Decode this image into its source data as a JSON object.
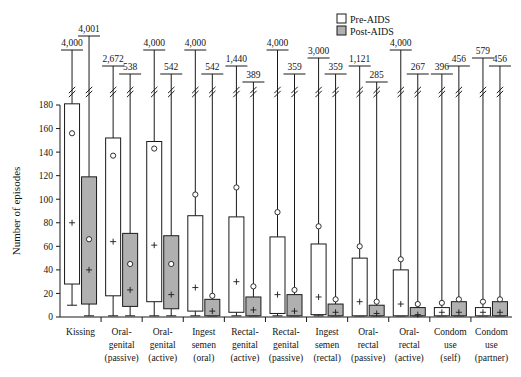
{
  "figure": {
    "y_axis_title": "Number of episodes",
    "legend": [
      {
        "key": "pre",
        "label": "Pre-AIDS",
        "color": "#ffffff"
      },
      {
        "key": "post",
        "label": "Post-AIDS",
        "color": "#b0b0b0"
      }
    ]
  },
  "chart_data": {
    "type": "bar",
    "title": "",
    "xlabel": "",
    "ylabel": "Number of episodes",
    "ylim": [
      0,
      180
    ],
    "yticks": [
      0,
      20,
      40,
      60,
      80,
      100,
      120,
      140,
      160,
      180
    ],
    "ytick_labels": [
      "0",
      "20",
      "40",
      "60",
      "80",
      "100",
      "120",
      "140",
      "160",
      "180"
    ],
    "grid": false,
    "legend_position": "top-right",
    "note": "Paired box-and-whisker plot. Each category has a Pre-AIDS (white) and Post-AIDS (grey) box. Upper whiskers are broken (axis break) and the true maximum is printed above each whisker.",
    "categories": [
      "Kissing",
      "Oral-genital (passive)",
      "Oral-genital (active)",
      "Ingest semen (oral)",
      "Rectal-genital (active)",
      "Rectal-genital (passive)",
      "Ingest semen (rectal)",
      "Oral-rectal (passive)",
      "Oral-rectal (active)",
      "Condom use (self)",
      "Condom use (partner)"
    ],
    "category_lines": [
      [
        "Kissing"
      ],
      [
        "Oral-",
        "genital",
        "(passive)"
      ],
      [
        "Oral-",
        "genital",
        "(active)"
      ],
      [
        "Ingest",
        "semen",
        "(oral)"
      ],
      [
        "Rectal-",
        "genital",
        "(active)"
      ],
      [
        "Rectal-",
        "genital",
        "(passive)"
      ],
      [
        "Ingest",
        "semen",
        "(rectal)"
      ],
      [
        "Oral-",
        "rectal",
        "(passive)"
      ],
      [
        "Oral-",
        "rectal",
        "(active)"
      ],
      [
        "Condom",
        "use",
        "(self)"
      ],
      [
        "Condom",
        "use",
        "(partner)"
      ]
    ],
    "series": [
      {
        "name": "Pre-AIDS",
        "color": "#ffffff",
        "boxes": [
          {
            "category": "Kissing",
            "q1": 28,
            "median": 181,
            "q3": 181,
            "lower_whisker": 10,
            "max_label": "4,000",
            "mean": 80,
            "marker_o": 156
          },
          {
            "category": "Oral-genital (passive)",
            "q1": 18,
            "median": 152,
            "q3": 152,
            "lower_whisker": 1,
            "max_label": "2,672",
            "mean": 64,
            "marker_o": 137
          },
          {
            "category": "Oral-genital (active)",
            "q1": 13,
            "median": 149,
            "q3": 149,
            "lower_whisker": 1,
            "max_label": "4,000",
            "mean": 61,
            "marker_o": 143
          },
          {
            "category": "Ingest semen (oral)",
            "q1": 5,
            "median": 86,
            "q3": 86,
            "lower_whisker": 1,
            "max_label": "4,000",
            "mean": 25,
            "marker_o": 104
          },
          {
            "category": "Rectal-genital (active)",
            "q1": 4,
            "median": 85,
            "q3": 85,
            "lower_whisker": 1,
            "max_label": "1,440",
            "mean": 30,
            "marker_o": 110
          },
          {
            "category": "Rectal-genital (passive)",
            "q1": 3,
            "median": 68,
            "q3": 68,
            "lower_whisker": 1,
            "max_label": "4,000",
            "mean": 19,
            "marker_o": 89
          },
          {
            "category": "Ingest semen (rectal)",
            "q1": 2,
            "median": 62,
            "q3": 62,
            "lower_whisker": 1,
            "max_label": "3,000",
            "mean": 17,
            "marker_o": 77
          },
          {
            "category": "Oral-rectal (passive)",
            "q1": 1,
            "median": 50,
            "q3": 50,
            "lower_whisker": 1,
            "max_label": "1,121",
            "mean": 13,
            "marker_o": 60
          },
          {
            "category": "Oral-rectal (active)",
            "q1": 1,
            "median": 40,
            "q3": 40,
            "lower_whisker": 1,
            "max_label": "4,000",
            "mean": 11,
            "marker_o": 49
          },
          {
            "category": "Condom use (self)",
            "q1": 1,
            "median": 6,
            "q3": 8,
            "lower_whisker": 1,
            "max_label": "396",
            "mean": 4,
            "marker_o": 12
          },
          {
            "category": "Condom use (partner)",
            "q1": 1,
            "median": 6,
            "q3": 8,
            "lower_whisker": 1,
            "max_label": "579",
            "mean": 4,
            "marker_o": 13
          }
        ]
      },
      {
        "name": "Post-AIDS",
        "color": "#b0b0b0",
        "boxes": [
          {
            "category": "Kissing",
            "q1": 11,
            "median": 119,
            "q3": 119,
            "lower_whisker": 1,
            "max_label": "4,001",
            "mean": 40,
            "marker_o": 66
          },
          {
            "category": "Oral-genital (passive)",
            "q1": 9,
            "median": 71,
            "q3": 71,
            "lower_whisker": 1,
            "max_label": "538",
            "mean": 23,
            "marker_o": 45
          },
          {
            "category": "Oral-genital (active)",
            "q1": 7,
            "median": 69,
            "q3": 69,
            "lower_whisker": 1,
            "max_label": "542",
            "mean": 19,
            "marker_o": 45
          },
          {
            "category": "Ingest semen (oral)",
            "q1": 1,
            "median": 15,
            "q3": 15,
            "lower_whisker": 1,
            "max_label": "542",
            "mean": 5,
            "marker_o": 18
          },
          {
            "category": "Rectal-genital (active)",
            "q1": 1,
            "median": 17,
            "q3": 17,
            "lower_whisker": 1,
            "max_label": "389",
            "mean": 6,
            "marker_o": 26
          },
          {
            "category": "Rectal-genital (passive)",
            "q1": 1,
            "median": 19,
            "q3": 19,
            "lower_whisker": 1,
            "max_label": "359",
            "mean": 5,
            "marker_o": 23
          },
          {
            "category": "Ingest semen (rectal)",
            "q1": 1,
            "median": 11,
            "q3": 11,
            "lower_whisker": 1,
            "max_label": "359",
            "mean": 4,
            "marker_o": 15
          },
          {
            "category": "Oral-rectal (passive)",
            "q1": 1,
            "median": 10,
            "q3": 10,
            "lower_whisker": 1,
            "max_label": "285",
            "mean": 3,
            "marker_o": 13
          },
          {
            "category": "Oral-rectal (active)",
            "q1": 1,
            "median": 8,
            "q3": 8,
            "lower_whisker": 1,
            "max_label": "267",
            "mean": 2,
            "marker_o": 11
          },
          {
            "category": "Condom use (self)",
            "q1": 1,
            "median": 13,
            "q3": 13,
            "lower_whisker": 1,
            "max_label": "456",
            "mean": 4,
            "marker_o": 15
          },
          {
            "category": "Condom use (partner)",
            "q1": 1,
            "median": 13,
            "q3": 13,
            "lower_whisker": 1,
            "max_label": "456",
            "mean": 4,
            "marker_o": 15
          }
        ]
      }
    ]
  }
}
